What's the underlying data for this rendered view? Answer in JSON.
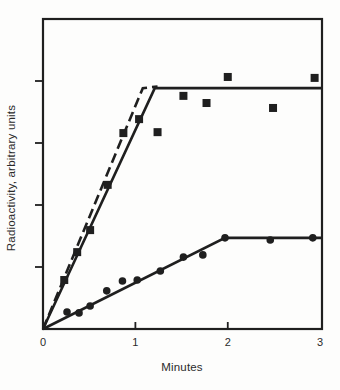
{
  "figure": {
    "background": "#fdfdfc",
    "ink_color": "#1f1f1f",
    "text_color": "#2b2b2b"
  },
  "chart_data": {
    "type": "scatter",
    "title": "",
    "xlabel": "Minutes",
    "ylabel": "Radioactivity, arbitrary units",
    "xlim": [
      0,
      3.02
    ],
    "ylim": [
      0,
      10
    ],
    "grid": false,
    "legend": "none",
    "x_ticks": [
      {
        "label": "0",
        "value": 0,
        "mark": false
      },
      {
        "label": "1",
        "value": 1,
        "mark": true
      },
      {
        "label": "2",
        "value": 2,
        "mark": true
      },
      {
        "label": "3",
        "value": 3,
        "mark": false
      }
    ],
    "y_ticks": {
      "values": [
        2,
        4,
        6,
        8
      ],
      "labels": []
    },
    "series": [
      {
        "name": "fast-component-squares",
        "marker": "filled-square",
        "points": [
          [
            0.23,
            1.58
          ],
          [
            0.37,
            2.48
          ],
          [
            0.51,
            3.19
          ],
          [
            0.7,
            4.65
          ],
          [
            0.87,
            6.32
          ],
          [
            1.04,
            6.77
          ],
          [
            1.24,
            6.35
          ],
          [
            1.52,
            7.52
          ],
          [
            1.77,
            7.29
          ],
          [
            2.0,
            8.13
          ],
          [
            2.49,
            7.13
          ],
          [
            2.94,
            8.1
          ]
        ]
      },
      {
        "name": "slow-component-circles",
        "marker": "filled-circle",
        "points": [
          [
            0.26,
            0.55
          ],
          [
            0.39,
            0.52
          ],
          [
            0.51,
            0.74
          ],
          [
            0.69,
            1.23
          ],
          [
            0.86,
            1.55
          ],
          [
            1.02,
            1.58
          ],
          [
            1.27,
            1.87
          ],
          [
            1.52,
            2.32
          ],
          [
            1.73,
            2.39
          ],
          [
            1.97,
            2.94
          ],
          [
            2.46,
            2.87
          ],
          [
            2.92,
            2.94
          ]
        ]
      }
    ],
    "fit_lines": [
      {
        "name": "squares-solid-fit",
        "style": "solid",
        "points": [
          [
            0,
            0
          ],
          [
            1.21,
            7.77
          ],
          [
            3.02,
            7.77
          ]
        ]
      },
      {
        "name": "squares-dashed-fit",
        "style": "dashed",
        "points": [
          [
            0,
            0
          ],
          [
            1.08,
            7.77
          ],
          [
            1.24,
            7.82
          ]
        ]
      },
      {
        "name": "circles-solid-fit",
        "style": "solid",
        "points": [
          [
            0,
            0
          ],
          [
            1.97,
            2.94
          ],
          [
            3.02,
            2.94
          ]
        ]
      }
    ]
  }
}
